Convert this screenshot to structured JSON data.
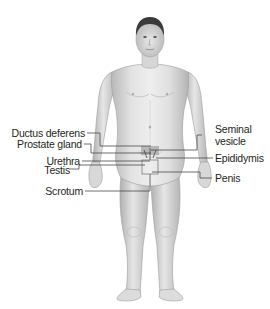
{
  "diagram": {
    "labels_left": [
      {
        "id": "ductus-deferens",
        "text": "Ductus deferens"
      },
      {
        "id": "prostate-gland",
        "text": "Prostate gland"
      },
      {
        "id": "urethra",
        "text": "Urethra"
      },
      {
        "id": "testis",
        "text": "Testis"
      },
      {
        "id": "scrotum",
        "text": "Scrotum"
      }
    ],
    "labels_right": [
      {
        "id": "seminal-vesicle",
        "text_line1": "Seminal",
        "text_line2": "vesicle"
      },
      {
        "id": "epididymis",
        "text": "Epididymis"
      },
      {
        "id": "penis",
        "text": "Penis"
      }
    ],
    "colors": {
      "skin_light": "#eeeeee",
      "skin_mid": "#d4d4d4",
      "skin_shadow": "#a9a9a9",
      "hair": "#3a3a3a",
      "leader_line": "#4a4a4a",
      "text": "#231f20"
    }
  }
}
